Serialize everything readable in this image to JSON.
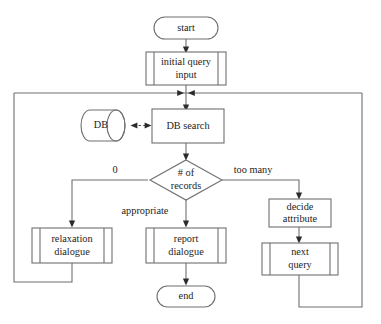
{
  "diagram": {
    "type": "flowchart",
    "colors": {
      "background": "#ffffff",
      "line": "#6f6f6f",
      "arrowhead": "#2b2b2b",
      "text": "#1d1d1d",
      "shape_fill": "#ffffff"
    },
    "nodes": {
      "start": {
        "label": "start",
        "shape": "terminator"
      },
      "initial_query_input": {
        "label_line1": "initial query",
        "label_line2": "input",
        "shape": "predefined-process"
      },
      "db": {
        "label": "DB",
        "shape": "cylinder"
      },
      "db_search": {
        "label": "DB search",
        "shape": "process"
      },
      "decision": {
        "label_line1": "# of",
        "label_line2": "records",
        "shape": "decision"
      },
      "relaxation_dialogue": {
        "label_line1": "relaxation",
        "label_line2": "dialogue",
        "shape": "predefined-process"
      },
      "report_dialogue": {
        "label_line1": "report",
        "label_line2": "dialogue",
        "shape": "predefined-process"
      },
      "decide_attribute": {
        "label_line1": "decide",
        "label_line2": "attribute",
        "shape": "process"
      },
      "next_query": {
        "label_line1": "next",
        "label_line2": "query",
        "shape": "predefined-process"
      },
      "end": {
        "label": "end",
        "shape": "terminator"
      }
    },
    "edge_labels": {
      "zero": "0",
      "too_many": "too many",
      "appropriate": "appropriate"
    },
    "edges": [
      {
        "from": "start",
        "to": "initial_query_input",
        "label": ""
      },
      {
        "from": "initial_query_input",
        "to": "db_search",
        "label": ""
      },
      {
        "from": "db",
        "to": "db_search",
        "label": "",
        "style": "dashed",
        "bidirectional": true
      },
      {
        "from": "db_search",
        "to": "decision",
        "label": ""
      },
      {
        "from": "decision",
        "to": "relaxation_dialogue",
        "label": "0"
      },
      {
        "from": "decision",
        "to": "report_dialogue",
        "label": "appropriate"
      },
      {
        "from": "decision",
        "to": "decide_attribute",
        "label": "too many"
      },
      {
        "from": "decide_attribute",
        "to": "next_query",
        "label": ""
      },
      {
        "from": "report_dialogue",
        "to": "end",
        "label": ""
      },
      {
        "from": "relaxation_dialogue",
        "to": "db_search",
        "label": "",
        "style": "loop-left"
      },
      {
        "from": "next_query",
        "to": "db_search",
        "label": "",
        "style": "loop-right"
      }
    ]
  }
}
